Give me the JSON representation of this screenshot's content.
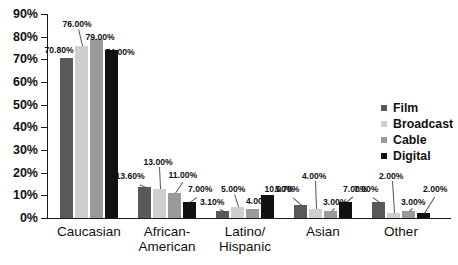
{
  "chart_data": {
    "type": "bar",
    "title": "",
    "xlabel": "",
    "ylabel": "",
    "ylim": [
      0,
      90
    ],
    "grid": false,
    "legend_position": "right",
    "y_ticks": [
      "0%",
      "10%",
      "20%",
      "30%",
      "40%",
      "50%",
      "60%",
      "70%",
      "80%",
      "90%"
    ],
    "y_tick_values": [
      0,
      10,
      20,
      30,
      40,
      50,
      60,
      70,
      80,
      90
    ],
    "categories": [
      "Caucasian",
      "African-\nAmerican",
      "Latino/\nHispanic",
      "Asian",
      "Other"
    ],
    "series": [
      {
        "name": "Film",
        "color": "#595959",
        "values": [
          70.8,
          13.6,
          3.1,
          5.7,
          7.0
        ],
        "labels": [
          "70.80%",
          "13.60%",
          "3.10%",
          "5.70%",
          "7.00%"
        ]
      },
      {
        "name": "Broadcast",
        "color": "#cfcfcf",
        "values": [
          76.0,
          13.0,
          5.0,
          4.0,
          2.0
        ],
        "labels": [
          "76.00%",
          "13.00%",
          "5.00%",
          "4.00%",
          "2.00%"
        ]
      },
      {
        "name": "Cable",
        "color": "#9a9a9a",
        "values": [
          79.0,
          11.0,
          4.0,
          3.0,
          3.0
        ],
        "labels": [
          "79.00%",
          "11.00%",
          "4.00%",
          "3.00%",
          "3.00%"
        ]
      },
      {
        "name": "Digital",
        "color": "#111111",
        "values": [
          74.0,
          7.0,
          10.0,
          7.0,
          2.0
        ],
        "labels": [
          "74.00%",
          "7.00%",
          "10.00%",
          "7.00%",
          "2.00%"
        ]
      }
    ]
  }
}
